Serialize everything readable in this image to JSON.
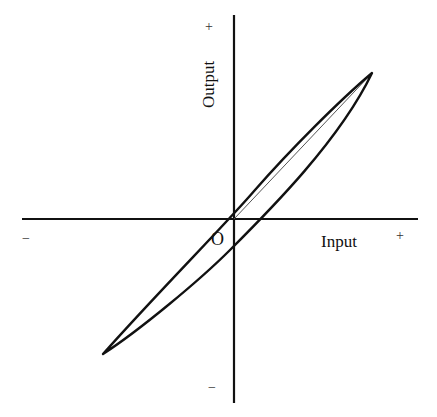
{
  "diagram": {
    "type": "hysteresis-loop",
    "x_axis": {
      "label": "Input",
      "positive": "+",
      "negative": "−"
    },
    "y_axis": {
      "label": "Output",
      "positive": "+",
      "negative": "−"
    },
    "origin_label": "O",
    "colors": {
      "stroke": "#111111",
      "thin_line": "#555555",
      "background": "#ffffff"
    }
  }
}
